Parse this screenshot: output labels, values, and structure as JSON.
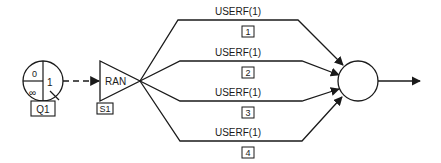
{
  "diagram": {
    "queue": {
      "label": "Q1",
      "top_left": "0",
      "bottom_left": "∞",
      "right": "1"
    },
    "source": {
      "label": "RAN",
      "tag": "S1"
    },
    "branches": [
      {
        "label": "USERF(1)",
        "number": "1"
      },
      {
        "label": "USERF(1)",
        "number": "2"
      },
      {
        "label": "USERF(1)",
        "number": "3"
      },
      {
        "label": "USERF(1)",
        "number": "4"
      }
    ],
    "colors": {
      "stroke": "#1a1a1a",
      "background": "#ffffff"
    }
  }
}
